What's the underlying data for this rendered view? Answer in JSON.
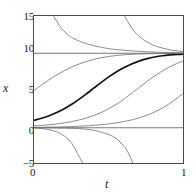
{
  "chart_data": {
    "type": "line",
    "title": "",
    "xlabel": "t",
    "ylabel": "x",
    "xlim": [
      0,
      1
    ],
    "ylim": [
      -5,
      15
    ],
    "grid": false,
    "legend": "none",
    "xticks": [
      {
        "value": 0,
        "label": "0"
      },
      {
        "value": 1,
        "label": "1"
      }
    ],
    "yticks": [
      {
        "value": -5,
        "label": "−5"
      },
      {
        "value": 0,
        "label": "0"
      },
      {
        "value": 5,
        "label": "5"
      },
      {
        "value": 10,
        "label": "10"
      },
      {
        "value": 15,
        "label": "15"
      }
    ],
    "equilibria": [
      {
        "name": "unstable-equilibrium-x0",
        "value": 0,
        "style": "thin-line"
      },
      {
        "name": "stable-equilibrium-x10",
        "value": 10,
        "style": "thin-line"
      }
    ],
    "series": [
      {
        "name": "solution-x0-1",
        "highlight": true,
        "initial_x": 1.0,
        "x": [
          0,
          0.05,
          0.1,
          0.15,
          0.2,
          0.25,
          0.3,
          0.35,
          0.4,
          0.45,
          0.5,
          0.55,
          0.6,
          0.65,
          0.7,
          0.75,
          0.8,
          0.85,
          0.9,
          0.95,
          1.0
        ],
        "values": [
          1.0,
          1.28,
          1.62,
          2.05,
          2.56,
          3.16,
          3.85,
          4.6,
          5.38,
          6.15,
          6.89,
          7.55,
          8.12,
          8.6,
          8.98,
          9.28,
          9.5,
          9.66,
          9.77,
          9.85,
          9.9
        ]
      },
      {
        "name": "solution-x0-5",
        "highlight": false,
        "initial_x": 5.0,
        "x": [
          0,
          0.05,
          0.1,
          0.15,
          0.2,
          0.25,
          0.3,
          0.35,
          0.4,
          0.45,
          0.5,
          0.55,
          0.6,
          0.65,
          0.7,
          0.75,
          0.8,
          0.85,
          0.9,
          0.95,
          1.0
        ],
        "values": [
          5.0,
          5.74,
          6.44,
          7.08,
          7.65,
          8.15,
          8.57,
          8.92,
          9.2,
          9.42,
          9.58,
          9.71,
          9.8,
          9.86,
          9.9,
          9.93,
          9.95,
          9.97,
          9.98,
          9.99,
          9.99
        ]
      },
      {
        "name": "solution-x0-0p25",
        "highlight": false,
        "initial_x": 0.25,
        "x": [
          0,
          0.05,
          0.1,
          0.15,
          0.2,
          0.25,
          0.3,
          0.35,
          0.4,
          0.45,
          0.5,
          0.55,
          0.6,
          0.65,
          0.7,
          0.75,
          0.8,
          0.85,
          0.9,
          0.95,
          1.0
        ],
        "values": [
          0.25,
          0.31,
          0.4,
          0.51,
          0.65,
          0.83,
          1.05,
          1.32,
          1.67,
          2.09,
          2.6,
          3.2,
          3.9,
          4.66,
          5.45,
          6.23,
          6.97,
          7.62,
          8.19,
          8.66,
          9.05
        ]
      },
      {
        "name": "solution-x0-0p05",
        "highlight": false,
        "initial_x": 0.05,
        "x": [
          0,
          0.05,
          0.1,
          0.15,
          0.2,
          0.25,
          0.3,
          0.35,
          0.4,
          0.45,
          0.5,
          0.55,
          0.6,
          0.65,
          0.7,
          0.75,
          0.8,
          0.85,
          0.9,
          0.95,
          1.0
        ],
        "values": [
          0.05,
          0.06,
          0.08,
          0.1,
          0.13,
          0.16,
          0.21,
          0.26,
          0.33,
          0.42,
          0.53,
          0.67,
          0.85,
          1.07,
          1.35,
          1.7,
          2.12,
          2.65,
          3.28,
          4.0,
          4.82
        ]
      },
      {
        "name": "solution-decaying-from-15-early",
        "highlight": false,
        "initial_x": 15.0,
        "x": [
          0.13,
          0.18,
          0.23,
          0.28,
          0.33,
          0.4,
          0.5,
          0.6,
          0.7,
          0.8,
          0.9,
          1.0
        ],
        "values": [
          15.0,
          13.4,
          12.4,
          11.8,
          11.4,
          11.0,
          10.6,
          10.4,
          10.25,
          10.15,
          10.1,
          10.05
        ]
      },
      {
        "name": "solution-decaying-from-15-late",
        "highlight": false,
        "initial_x": 15.0,
        "x": [
          0.6,
          0.65,
          0.7,
          0.75,
          0.8,
          0.85,
          0.9,
          0.95,
          1.0
        ],
        "values": [
          15.0,
          13.3,
          12.2,
          11.5,
          11.0,
          10.7,
          10.45,
          10.3,
          10.2
        ]
      },
      {
        "name": "solution-diverging-below-zero-early",
        "highlight": false,
        "initial_x": -0.02,
        "x": [
          0,
          0.05,
          0.1,
          0.15,
          0.2,
          0.25,
          0.3,
          0.33
        ],
        "values": [
          -0.02,
          -0.1,
          -0.26,
          -0.55,
          -1.1,
          -2.1,
          -3.9,
          -5.0
        ]
      },
      {
        "name": "solution-diverging-below-zero-late",
        "highlight": false,
        "initial_x": -0.002,
        "x": [
          0,
          0.1,
          0.2,
          0.3,
          0.4,
          0.5,
          0.55,
          0.6,
          0.63,
          0.66
        ],
        "values": [
          -0.002,
          -0.01,
          -0.04,
          -0.12,
          -0.35,
          -0.95,
          -1.55,
          -2.6,
          -3.6,
          -5.0
        ]
      }
    ]
  }
}
